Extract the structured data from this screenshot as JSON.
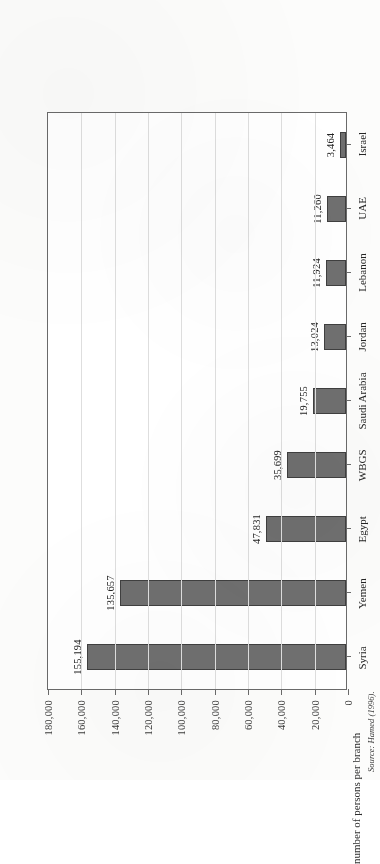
{
  "figure": {
    "source_note": "Source: Hamed (1996)."
  },
  "chart_data": {
    "type": "bar",
    "title": "",
    "subtitle": "",
    "xlabel": "",
    "ylabel": "number of persons per branch",
    "orientation": "vertical",
    "grid": true,
    "legend": "none",
    "ylim": [
      0,
      180000
    ],
    "ytick_step": 20000,
    "categories": [
      "Syria",
      "Yemen",
      "Egypt",
      "WBGS",
      "Saudi Arabia",
      "Jordan",
      "Lebanon",
      "UAE",
      "Israel"
    ],
    "values": [
      155194,
      135657,
      47831,
      35699,
      19755,
      13024,
      11924,
      11260,
      3464
    ],
    "value_labels": [
      "155,194",
      "135,657",
      "47,831",
      "35,699",
      "19,755",
      "13,024",
      "11,924",
      "11,260",
      "3,464"
    ],
    "ytick_labels": [
      "0",
      "20,000",
      "40,000",
      "60,000",
      "80,000",
      "100,000",
      "120,000",
      "140,000",
      "160,000",
      "180,000"
    ],
    "ytick_values": [
      0,
      20000,
      40000,
      60000,
      80000,
      100000,
      120000,
      140000,
      160000,
      180000
    ],
    "colors": {
      "bar_fill": "#6f6f6f",
      "bar_border": "#3f3f3f",
      "gridline": "#dedede",
      "axis": "#6a6a6a",
      "plot_background": "#ffffff",
      "page_background": "#fcfcfb",
      "text": "#242424"
    }
  }
}
